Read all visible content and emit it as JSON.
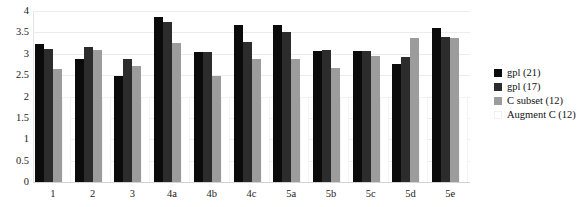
{
  "chart_data": {
    "type": "bar",
    "title": "",
    "xlabel": "",
    "ylabel": "",
    "ylim": [
      0,
      4
    ],
    "ytick_labels": [
      "4",
      "3.5",
      "3",
      "2.5",
      "2",
      "1.5",
      "1",
      "0.5",
      "0"
    ],
    "ytick_values": [
      4,
      3.5,
      3,
      2.5,
      2,
      1.5,
      1,
      0.5,
      0
    ],
    "grid": true,
    "legend_position": "right",
    "categories": [
      "1",
      "2",
      "3",
      "4a",
      "4b",
      "4c",
      "5a",
      "5b",
      "5c",
      "5d",
      "5e"
    ],
    "series": [
      {
        "name": "gpl (21)",
        "color": "#0b0b0b",
        "values": [
          3.24,
          2.87,
          2.47,
          3.87,
          3.04,
          3.68,
          3.68,
          3.07,
          3.06,
          2.76,
          3.6
        ]
      },
      {
        "name": "gpl (17)",
        "color": "#2c2c2c",
        "values": [
          3.11,
          3.15,
          2.88,
          3.75,
          3.04,
          3.28,
          3.5,
          3.08,
          3.06,
          2.93,
          3.4
        ]
      },
      {
        "name": "C subset (12)",
        "color": "#9c9c9c",
        "values": [
          2.65,
          3.08,
          2.72,
          3.25,
          2.48,
          2.88,
          2.88,
          2.67,
          2.94,
          3.38,
          3.38
        ]
      },
      {
        "name": "Augment C (12)",
        "color": "#ffffff",
        "values": [
          0,
          0,
          0,
          0,
          0,
          0,
          0,
          0,
          0,
          0,
          0
        ]
      }
    ]
  },
  "legend": {
    "entries": [
      {
        "label": "gpl (21)",
        "swatch": "black-swatch"
      },
      {
        "label": "gpl (17)",
        "swatch": "dark-gray-swatch"
      },
      {
        "label": "C subset (12)",
        "swatch": "medium-gray-swatch"
      },
      {
        "label": "Augment C (12)",
        "swatch": "white-swatch"
      }
    ]
  },
  "colors": {
    "series_0": "#0b0b0b",
    "series_1": "#2c2c2c",
    "series_2": "#9c9c9c",
    "series_3": "#ffffff",
    "gridline": "#ececec",
    "axis": "#d2d2d2",
    "text": "#1c1c1c",
    "background": "#ffffff"
  }
}
